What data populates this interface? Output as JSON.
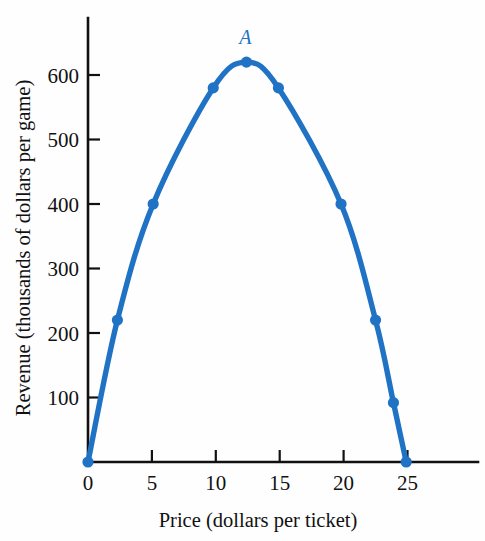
{
  "chart_data": {
    "type": "line",
    "title": "",
    "subtitle": "",
    "xlabel": "Price (dollars per ticket)",
    "ylabel": "Revenue (thousands of dollars per game)",
    "xlim": [
      0,
      29
    ],
    "ylim": [
      0,
      660
    ],
    "xticks": [
      0,
      5,
      10,
      15,
      20,
      25
    ],
    "xtick_labels": [
      "0",
      "5",
      "10",
      "15",
      "20",
      "25"
    ],
    "yticks": [
      100,
      200,
      300,
      400,
      500,
      600
    ],
    "ytick_labels": [
      "100",
      "200",
      "300",
      "400",
      "500",
      "600"
    ],
    "grid": false,
    "legend": null,
    "series": [
      {
        "name": "Revenue",
        "color": "#1f72c4",
        "marker": "circle",
        "x": [
          0,
          2.3,
          5.1,
          9.8,
          12.4,
          14.9,
          19.8,
          22.5,
          23.9,
          24.9
        ],
        "y": [
          0,
          220,
          400,
          580,
          620,
          580,
          400,
          220,
          92,
          0
        ],
        "points": [
          {
            "x": 0,
            "y": 0
          },
          {
            "x": 2.3,
            "y": 220
          },
          {
            "x": 5.1,
            "y": 400
          },
          {
            "x": 9.8,
            "y": 580
          },
          {
            "x": 12.4,
            "y": 620
          },
          {
            "x": 14.9,
            "y": 580
          },
          {
            "x": 19.8,
            "y": 400
          },
          {
            "x": 22.5,
            "y": 220
          },
          {
            "x": 23.9,
            "y": 92
          },
          {
            "x": 24.9,
            "y": 0
          }
        ]
      }
    ],
    "annotations": [
      {
        "label": "A",
        "x": 12.4,
        "y": 620,
        "description": "maximum revenue point",
        "color": "#1f72c4"
      }
    ]
  },
  "axis": {
    "tick_color": "#111111",
    "line_color": "#111111"
  },
  "colors": {
    "curve": "#1f72c4",
    "marker": "#1f72c4",
    "annotation": "#1f72c4",
    "axis": "#111111",
    "background": "#fefefe"
  }
}
